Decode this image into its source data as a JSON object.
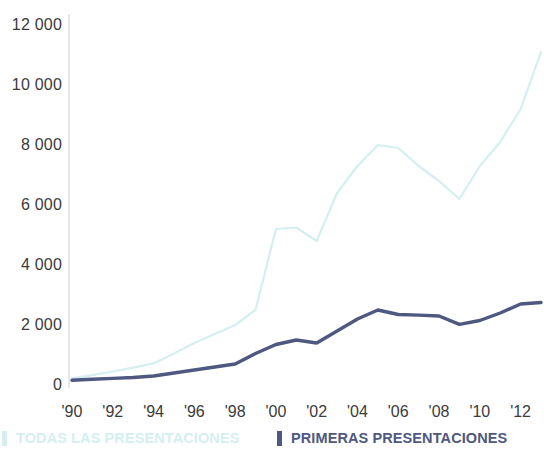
{
  "chart_data": {
    "type": "line",
    "title": "",
    "subtitle": "",
    "xlabel": "",
    "ylabel": "",
    "xlim": [
      1990,
      2013
    ],
    "ylim": [
      0,
      12000
    ],
    "grid": false,
    "legend_position": "bottom",
    "x": [
      1990,
      1991,
      1992,
      1993,
      1994,
      1995,
      1996,
      1997,
      1998,
      1999,
      2000,
      2001,
      2002,
      2003,
      2004,
      2005,
      2006,
      2007,
      2008,
      2009,
      2010,
      2011,
      2012,
      2013
    ],
    "x_tick_labels": [
      "'90",
      "'92",
      "'94",
      "'96",
      "'98",
      "'00",
      "'02",
      "'04",
      "'06",
      "'08",
      "'10",
      "'12"
    ],
    "x_tick_values": [
      1990,
      1992,
      1994,
      1996,
      1998,
      2000,
      2002,
      2004,
      2006,
      2008,
      2010,
      2012
    ],
    "y_tick_labels": [
      "12 000",
      "10 000",
      "8 000",
      "6 000",
      "4 000",
      "2 000",
      "0"
    ],
    "y_tick_values": [
      12000,
      10000,
      8000,
      6000,
      4000,
      2000,
      0
    ],
    "series": [
      {
        "name": "TODAS LAS PRESENTACIONES",
        "color": "#d5eff0",
        "values": [
          220,
          330,
          450,
          580,
          720,
          1050,
          1400,
          1700,
          2000,
          2500,
          5200,
          5250,
          4800,
          6400,
          7300,
          8000,
          7900,
          7300,
          6800,
          6200,
          7300,
          8100,
          9200,
          11100
        ]
      },
      {
        "name": "PRIMERAS PRESENTACIONES",
        "color": "#4e5880",
        "values": [
          160,
          190,
          220,
          250,
          300,
          400,
          500,
          600,
          700,
          1050,
          1350,
          1500,
          1400,
          1800,
          2200,
          2500,
          2350,
          2330,
          2300,
          2020,
          2150,
          2400,
          2700,
          2750
        ]
      }
    ]
  },
  "axis": {
    "axis_line_color": "#d8d8d8",
    "tick_text_color": "#3b3b3b"
  },
  "legend": {
    "items": [
      {
        "label": "TODAS LAS PRESENTACIONES",
        "color": "#d5eff0"
      },
      {
        "label": "PRIMERAS PRESENTACIONES",
        "color": "#4e5880"
      }
    ]
  }
}
